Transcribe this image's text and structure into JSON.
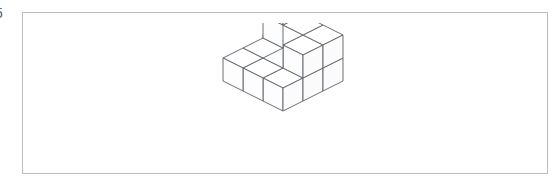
{
  "page": {
    "background_color": "#ffffff",
    "width": 560,
    "height": 191
  },
  "edge_label": {
    "text": "5",
    "note": "clipped character at left edge of image"
  },
  "panel": {
    "border_color": "#b9bdc1",
    "background_color": "#ffffff"
  },
  "figure": {
    "name": "isometric-cube-stack",
    "line_color": "#5a6066",
    "face_color": "#ffffff",
    "projection": "isometric",
    "grid": {
      "columns": 3,
      "rows": 3
    },
    "height_map": [
      [
        3,
        2,
        2
      ],
      [
        1,
        2,
        2
      ],
      [
        1,
        1,
        1
      ]
    ],
    "total_cubes": 15
  }
}
